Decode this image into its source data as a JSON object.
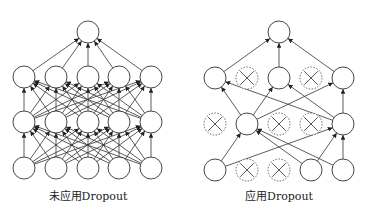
{
  "diagrams": [
    {
      "id": "standard",
      "caption": "未应用Dropout",
      "caption_pos": [
        88,
        196
      ],
      "layers": [
        {
          "name": "output",
          "nodes": [
            [
              88,
              32,
              true
            ]
          ]
        },
        {
          "name": "hidden2",
          "nodes": [
            [
              24,
              77,
              true
            ],
            [
              56,
              77,
              true
            ],
            [
              88,
              77,
              true
            ],
            [
              119,
              77,
              true
            ],
            [
              151,
              77,
              true
            ]
          ]
        },
        {
          "name": "hidden1",
          "nodes": [
            [
              24,
              122,
              true
            ],
            [
              56,
              122,
              true
            ],
            [
              88,
              122,
              true
            ],
            [
              119,
              122,
              true
            ],
            [
              151,
              122,
              true
            ]
          ]
        },
        {
          "name": "input",
          "nodes": [
            [
              24,
              168,
              true
            ],
            [
              56,
              168,
              true
            ],
            [
              88,
              168,
              true
            ],
            [
              119,
              168,
              true
            ],
            [
              151,
              168,
              true
            ]
          ]
        }
      ],
      "edges": "full"
    },
    {
      "id": "dropout",
      "caption": "应用Dropout",
      "caption_pos": [
        279,
        196
      ],
      "layers": [
        {
          "name": "output",
          "nodes": [
            [
              279,
              32,
              true
            ]
          ]
        },
        {
          "name": "hidden2",
          "nodes": [
            [
              215,
              78,
              true
            ],
            [
              247,
              78,
              false
            ],
            [
              279,
              78,
              true
            ],
            [
              311,
              78,
              false
            ],
            [
              343,
              78,
              true
            ]
          ]
        },
        {
          "name": "hidden1",
          "nodes": [
            [
              215,
              124,
              false
            ],
            [
              247,
              124,
              true
            ],
            [
              279,
              124,
              false
            ],
            [
              311,
              124,
              false
            ],
            [
              343,
              124,
              true
            ]
          ]
        },
        {
          "name": "input",
          "nodes": [
            [
              215,
              170,
              true
            ],
            [
              247,
              170,
              false
            ],
            [
              279,
              170,
              false
            ],
            [
              311,
              170,
              true
            ],
            [
              343,
              170,
              true
            ]
          ]
        }
      ],
      "edges": [
        [
          [
            2,
            1
          ],
          [
            1,
            0
          ]
        ],
        [
          [
            2,
            4
          ],
          [
            1,
            0
          ]
        ],
        [
          [
            3,
            0
          ],
          [
            2,
            1
          ]
        ],
        [
          [
            3,
            3
          ],
          [
            2,
            1
          ]
        ],
        [
          [
            3,
            4
          ],
          [
            2,
            1
          ]
        ],
        [
          [
            3,
            0
          ],
          [
            2,
            4
          ]
        ],
        [
          [
            3,
            3
          ],
          [
            2,
            4
          ]
        ],
        [
          [
            3,
            4
          ],
          [
            2,
            4
          ]
        ],
        [
          [
            2,
            1
          ],
          [
            1,
            0
          ]
        ],
        [
          [
            2,
            4
          ],
          [
            1,
            0
          ]
        ],
        [
          [
            2,
            1
          ],
          [
            1,
            2
          ]
        ],
        [
          [
            2,
            4
          ],
          [
            1,
            2
          ]
        ],
        [
          [
            2,
            1
          ],
          [
            1,
            4
          ]
        ],
        [
          [
            2,
            4
          ],
          [
            1,
            4
          ]
        ],
        [
          [
            1,
            0
          ],
          [
            0,
            0
          ]
        ],
        [
          [
            1,
            2
          ],
          [
            0,
            0
          ]
        ],
        [
          [
            1,
            4
          ],
          [
            0,
            0
          ]
        ]
      ]
    }
  ],
  "style": {
    "node_radius": 11,
    "stroke": "#333333",
    "dropped_stroke": "#555555",
    "edge_stroke": "#333333"
  }
}
